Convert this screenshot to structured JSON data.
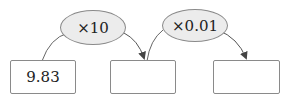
{
  "diagram": {
    "boxes": [
      {
        "value": "9.83"
      },
      {
        "value": ""
      },
      {
        "value": ""
      }
    ],
    "operations": [
      {
        "label": "×10"
      },
      {
        "label": "×0.01"
      }
    ],
    "colors": {
      "oval_fill": "#ececec",
      "stroke": "#8a8a8a"
    }
  }
}
